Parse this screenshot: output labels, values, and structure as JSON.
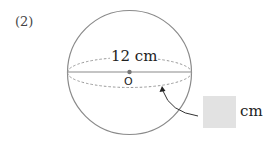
{
  "problem": {
    "number": "(2)"
  },
  "sphere": {
    "diameter_label": "12 cm",
    "center_label": "O"
  },
  "answer": {
    "box_value": "",
    "unit": "cm"
  },
  "colors": {
    "outline": "#8a8a8a",
    "answer_box": "#e2e2e2"
  }
}
